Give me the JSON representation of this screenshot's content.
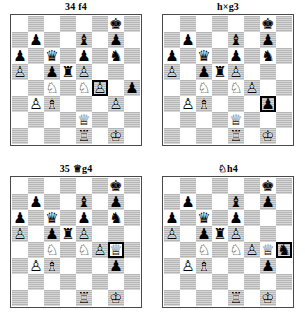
{
  "page": {
    "type": "chess-diagram-sheet",
    "diagram_count": 4,
    "board_size": 8,
    "colors": {
      "light_square": "#ffffff",
      "dark_square": "#b6b6b6",
      "border": "#4a4a4a",
      "highlight": "#000000",
      "text": "#000000"
    }
  },
  "glyphs": {
    "white_king": "♔",
    "white_queen": "♕",
    "white_rook": "♖",
    "white_bishop": "♗",
    "white_knight": "♘",
    "white_pawn": "♙",
    "black_king": "♚",
    "black_queen": "♛",
    "black_rook": "♜",
    "black_bishop": "♝",
    "black_knight": "♞",
    "black_pawn": "♟"
  },
  "diagrams": [
    {
      "id": "diagram-1",
      "title": "34 f4",
      "title_move_number": "34",
      "title_move": "f4",
      "title_figurine": "",
      "highlight": "f4",
      "pieces": {
        "g8": "black_king",
        "b7": "black_pawn",
        "e7": "black_bishop",
        "g7": "black_pawn",
        "a6": "black_pawn",
        "c6": "black_queen",
        "e6": "black_pawn",
        "g6": "black_knight",
        "a5": "white_pawn",
        "c5": "black_pawn",
        "d5": "black_rook",
        "e5": "white_pawn",
        "c4": "white_knight",
        "e4": "white_knight",
        "f4": "white_pawn",
        "h4": "black_pawn",
        "b3": "white_pawn",
        "c3": "white_bishop",
        "g3": "white_pawn",
        "e2": "white_queen",
        "e1": "white_rook",
        "g1": "white_king"
      }
    },
    {
      "id": "diagram-2",
      "title": "h×g3",
      "title_move_number": "",
      "title_move": "h×g3",
      "title_figurine": "",
      "highlight": "g3",
      "pieces": {
        "g8": "black_king",
        "b7": "black_pawn",
        "e7": "black_bishop",
        "g7": "black_pawn",
        "a6": "black_pawn",
        "c6": "black_queen",
        "e6": "black_pawn",
        "g6": "black_knight",
        "a5": "white_pawn",
        "c5": "black_pawn",
        "d5": "black_rook",
        "e5": "white_pawn",
        "c4": "white_knight",
        "e4": "white_knight",
        "f4": "white_pawn",
        "b3": "white_pawn",
        "c3": "white_bishop",
        "g3": "black_pawn",
        "e2": "white_queen",
        "e1": "white_rook",
        "g1": "white_king"
      }
    },
    {
      "id": "diagram-3",
      "title": "35 ♕g4",
      "title_move_number": "35",
      "title_move": "g4",
      "title_figurine": "white_queen",
      "highlight": "g4",
      "pieces": {
        "g8": "black_king",
        "b7": "black_pawn",
        "e7": "black_bishop",
        "g7": "black_pawn",
        "a6": "black_pawn",
        "c6": "black_queen",
        "e6": "black_pawn",
        "g6": "black_knight",
        "a5": "white_pawn",
        "c5": "black_pawn",
        "d5": "black_rook",
        "e5": "white_pawn",
        "c4": "white_knight",
        "e4": "white_knight",
        "f4": "white_pawn",
        "g4": "white_queen",
        "b3": "white_pawn",
        "c3": "white_bishop",
        "g3": "black_pawn",
        "e1": "white_rook",
        "g1": "white_king"
      }
    },
    {
      "id": "diagram-4",
      "title": "♘h4",
      "title_move_number": "",
      "title_move": "h4",
      "title_figurine": "black_knight",
      "highlight": "h4",
      "pieces": {
        "g8": "black_king",
        "b7": "black_pawn",
        "e7": "black_bishop",
        "g7": "black_pawn",
        "a6": "black_pawn",
        "c6": "black_queen",
        "e6": "black_pawn",
        "a5": "white_pawn",
        "c5": "black_pawn",
        "d5": "black_rook",
        "e5": "white_pawn",
        "c4": "white_knight",
        "e4": "white_knight",
        "f4": "white_pawn",
        "g4": "white_queen",
        "h4": "black_knight",
        "b3": "white_pawn",
        "c3": "white_bishop",
        "g3": "black_pawn",
        "e1": "white_rook",
        "g1": "white_king"
      }
    }
  ]
}
